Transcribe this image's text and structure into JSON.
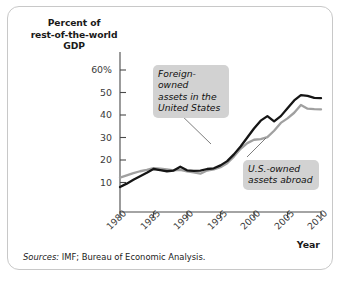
{
  "figure": {
    "y_axis_title": "Percent of\nrest-of-the-world\nGDP",
    "y_axis_title_lines": [
      "Percent of",
      "rest-of-the-world",
      "GDP"
    ],
    "x_axis_title": "Year",
    "source_prefix": "Sources:",
    "source_text": " IMF; Bureau of Economic Analysis.",
    "source_full": "Sources: IMF; Bureau of Economic Analysis.",
    "annotations": [
      {
        "name": "foreign-owned-callout",
        "lines": [
          "Foreign-owned",
          "assets in the",
          "United States"
        ],
        "text": "Foreign-owned assets in the United States"
      },
      {
        "name": "us-owned-callout",
        "lines": [
          "U.S.-owned",
          "assets abroad"
        ],
        "text": "U.S.-owned assets abroad"
      }
    ],
    "colors": {
      "foreign_owned_line": "#151515",
      "us_owned_line": "#a0a0a0",
      "callout_background": "#d2d2d2",
      "axis": "#4a4a4a",
      "frame_border": "#c8c8c8",
      "background": "#ffffff"
    }
  },
  "chart_data": {
    "type": "line",
    "title": "",
    "xlabel": "Year",
    "ylabel": "Percent of rest-of-the-world GDP",
    "xlim": [
      1980,
      2010
    ],
    "ylim": [
      0,
      63
    ],
    "grid": false,
    "legend": "annotated callouts",
    "ytick_labels": [
      "60%",
      "50",
      "40",
      "30",
      "20",
      "10"
    ],
    "ytick_values": [
      60,
      50,
      40,
      30,
      20,
      10
    ],
    "xtick_labels": [
      "1980",
      "1985",
      "1990",
      "1995",
      "2000",
      "2005",
      "2010"
    ],
    "xtick_values": [
      1980,
      1985,
      1990,
      1995,
      2000,
      2005,
      2010
    ],
    "x": [
      1980,
      1981,
      1982,
      1983,
      1984,
      1985,
      1986,
      1987,
      1988,
      1989,
      1990,
      1991,
      1992,
      1993,
      1994,
      1995,
      1996,
      1997,
      1998,
      1999,
      2000,
      2001,
      2002,
      2003,
      2004,
      2005,
      2006,
      2007,
      2008,
      2009,
      2010
    ],
    "series": [
      {
        "name": "Foreign-owned assets in the United States",
        "color": "#151515",
        "values": [
          8.0,
          9.5,
          11.2,
          12.8,
          14.3,
          16.0,
          15.5,
          15.0,
          15.3,
          17.0,
          15.4,
          15.2,
          15.3,
          16.0,
          16.3,
          17.6,
          19.5,
          22.5,
          26.0,
          30.0,
          34.0,
          37.5,
          39.5,
          37.2,
          39.5,
          43.0,
          46.5,
          48.8,
          48.5,
          47.6,
          47.5
        ]
      },
      {
        "name": "U.S.-owned assets abroad",
        "color": "#a0a0a0",
        "values": [
          12.2,
          13.2,
          14.2,
          15.0,
          15.6,
          16.4,
          16.2,
          15.8,
          15.4,
          15.6,
          14.9,
          14.5,
          13.9,
          15.3,
          15.8,
          16.8,
          18.6,
          21.5,
          25.0,
          27.5,
          29.0,
          29.3,
          30.2,
          33.0,
          36.5,
          38.5,
          41.0,
          44.5,
          42.8,
          42.6,
          42.5
        ]
      }
    ]
  }
}
